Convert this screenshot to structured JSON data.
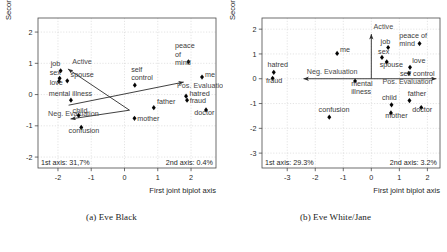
{
  "figure": {
    "panels": [
      {
        "id": "panel-a",
        "caption": "(a) Eve Black",
        "xlabel": "First joint biplot axis",
        "ylabel": "Second joint biplot axis",
        "axis1_note": "1st axis: 31,7%",
        "axis2_note": "2nd axis:  0.4%",
        "xticks": [
          "-2",
          "-1",
          "0",
          "1",
          "2"
        ],
        "yticks": [
          "2",
          "1",
          "0",
          "-1",
          "-2"
        ]
      },
      {
        "id": "panel-b",
        "caption": "(b) Eve White/Jane",
        "xlabel": "First joint biplot axis",
        "ylabel": "Second joint biplot axis",
        "axis1_note": "1st axis: 29.3%",
        "axis2_note": "2nd axis:   3.2%",
        "xticks": [
          "-3",
          "-2",
          "-1",
          "0",
          "1",
          "2"
        ],
        "yticks": [
          "2",
          "1",
          "0",
          "-1",
          "-2",
          "-3"
        ]
      }
    ]
  },
  "chart_data": [
    {
      "type": "scatter",
      "title": "(a) Eve Black",
      "xlabel": "First joint biplot axis",
      "ylabel": "Second joint biplot axis",
      "xlim": [
        -2.6,
        2.75
      ],
      "ylim": [
        -2.35,
        2.45
      ],
      "grid": true,
      "annotations": [
        "1st axis: 31,7%",
        "2nd axis:  0.4%"
      ],
      "points": [
        {
          "label": "job",
          "x": -1.92,
          "y": 0.76,
          "lx": -2.22,
          "ly": 0.93,
          "anchor": "start"
        },
        {
          "label": "sex",
          "x": -1.95,
          "y": 0.52,
          "lx": -2.25,
          "ly": 0.62,
          "anchor": "start"
        },
        {
          "label": "spouse",
          "x": -1.72,
          "y": 0.44,
          "lx": -1.62,
          "ly": 0.56,
          "anchor": "start"
        },
        {
          "label": "love",
          "x": -1.97,
          "y": 0.42,
          "lx": -2.25,
          "ly": 0.3,
          "anchor": "start"
        },
        {
          "label": "mental illness",
          "x": -1.61,
          "y": -0.18,
          "lx": -2.28,
          "ly": -0.03,
          "anchor": "start"
        },
        {
          "label": "child",
          "x": -1.38,
          "y": -0.67,
          "lx": -1.56,
          "ly": -0.58,
          "anchor": "start"
        },
        {
          "label": "confusion",
          "x": -1.3,
          "y": -1.05,
          "lx": -1.68,
          "ly": -1.24,
          "anchor": "start"
        },
        {
          "label": "self\ncontrol",
          "x": 0.31,
          "y": 0.3,
          "lx": 0.2,
          "ly": 0.72,
          "anchor": "start"
        },
        {
          "label": "mother",
          "x": 0.3,
          "y": -0.76,
          "lx": 0.38,
          "ly": -0.86,
          "anchor": "start"
        },
        {
          "label": "father",
          "x": 0.88,
          "y": -0.42,
          "lx": 0.98,
          "ly": -0.3,
          "anchor": "start"
        },
        {
          "label": "peace\nof\nmind",
          "x": 1.92,
          "y": 1.05,
          "lx": 1.52,
          "ly": 1.48,
          "anchor": "start"
        },
        {
          "label": "me",
          "x": 2.33,
          "y": 0.56,
          "lx": 2.42,
          "ly": 0.56,
          "anchor": "start"
        },
        {
          "label": "hatred",
          "x": 1.85,
          "y": -0.05,
          "lx": 1.95,
          "ly": -0.04,
          "anchor": "start"
        },
        {
          "label": "fraud",
          "x": 1.88,
          "y": -0.18,
          "lx": 1.96,
          "ly": -0.26,
          "anchor": "start"
        },
        {
          "label": "doctor",
          "x": 2.45,
          "y": -0.49,
          "lx": 2.1,
          "ly": -0.66,
          "anchor": "start"
        }
      ],
      "vectors": [
        {
          "label": "Active",
          "x0": 0.15,
          "y0": -0.5,
          "x1": -1.7,
          "y1": 0.82,
          "lx": -1.57,
          "ly": 0.98,
          "anchor": "start"
        },
        {
          "label": "Pos. Evaluation",
          "x0": -1.68,
          "y0": -0.34,
          "x1": 1.78,
          "y1": 0.4,
          "lx": 1.58,
          "ly": 0.2,
          "anchor": "start"
        },
        {
          "label": "Neg. Evaluation",
          "x0": 0.15,
          "y0": -0.5,
          "x1": -1.62,
          "y1": -0.78,
          "lx": -2.3,
          "ly": -0.7,
          "anchor": "start"
        }
      ]
    },
    {
      "type": "scatter",
      "title": "(b) Eve White/Jane",
      "xlabel": "First joint biplot axis",
      "ylabel": "Second joint biplot axis",
      "xlim": [
        -3.9,
        2.45
      ],
      "ylim": [
        -3.6,
        2.45
      ],
      "grid": true,
      "annotations": [
        "1st axis: 29.3%",
        "2nd axis:   3.2%"
      ],
      "points": [
        {
          "label": "hatred",
          "x": -3.48,
          "y": 0.26,
          "lx": -3.7,
          "ly": 0.48,
          "anchor": "start"
        },
        {
          "label": "fraud",
          "x": -3.52,
          "y": 0.02,
          "lx": -3.76,
          "ly": -0.18,
          "anchor": "start"
        },
        {
          "label": "me",
          "x": -1.22,
          "y": 1.02,
          "lx": -1.12,
          "ly": 1.06,
          "anchor": "start"
        },
        {
          "label": "mental\nillness",
          "x": -0.58,
          "y": -0.09,
          "lx": -0.72,
          "ly": -0.3,
          "anchor": "start"
        },
        {
          "label": "confusion",
          "x": -1.5,
          "y": -1.55,
          "lx": -1.88,
          "ly": -1.34,
          "anchor": "start"
        },
        {
          "label": "job",
          "x": 0.6,
          "y": 1.26,
          "lx": 0.33,
          "ly": 1.4,
          "anchor": "start"
        },
        {
          "label": "sex",
          "x": 0.38,
          "y": 0.86,
          "lx": 0.24,
          "ly": 1.0,
          "anchor": "start"
        },
        {
          "label": "spouse",
          "x": 0.55,
          "y": 0.68,
          "lx": 0.3,
          "ly": 0.46,
          "anchor": "start"
        },
        {
          "label": "peace of\nmind",
          "x": 1.72,
          "y": 1.42,
          "lx": 1.0,
          "ly": 1.66,
          "anchor": "start"
        },
        {
          "label": "love",
          "x": 1.38,
          "y": 0.46,
          "lx": 1.46,
          "ly": 0.62,
          "anchor": "start"
        },
        {
          "label": "self control",
          "x": 1.34,
          "y": 0.22,
          "lx": 1.02,
          "ly": 0.12,
          "anchor": "start"
        },
        {
          "label": "child",
          "x": 0.72,
          "y": -1.05,
          "lx": 0.38,
          "ly": -0.86,
          "anchor": "start"
        },
        {
          "label": "father",
          "x": 1.36,
          "y": -0.88,
          "lx": 1.3,
          "ly": -0.7,
          "anchor": "start"
        },
        {
          "label": "mother",
          "x": 0.7,
          "y": -1.38,
          "lx": 0.5,
          "ly": -1.58,
          "anchor": "start"
        },
        {
          "label": "doctor",
          "x": 1.78,
          "y": -1.16,
          "lx": 1.46,
          "ly": -1.36,
          "anchor": "start"
        }
      ],
      "vectors": [
        {
          "label": "Active",
          "x0": 0.0,
          "y0": 0.0,
          "x1": 0.0,
          "y1": 1.8,
          "lx": 0.08,
          "ly": 2.0,
          "anchor": "start"
        },
        {
          "label": "Pos. Evaluation",
          "x0": 0.0,
          "y0": 0.0,
          "x1": 2.32,
          "y1": 0.0,
          "lx": 0.4,
          "ly": -0.22,
          "anchor": "start"
        },
        {
          "label": "Neg. Evaluation",
          "x0": 0.0,
          "y0": 0.0,
          "x1": -2.42,
          "y1": 0.0,
          "lx": -2.3,
          "ly": 0.18,
          "anchor": "start"
        }
      ]
    }
  ]
}
